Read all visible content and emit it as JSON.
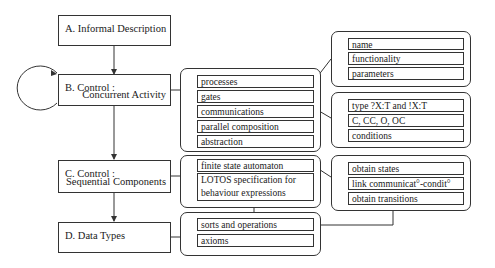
{
  "stages": {
    "a": {
      "line1": "A. Informal Description",
      "line2": ""
    },
    "b": {
      "line1": "B. Control :",
      "line2": "Concurrent Activity"
    },
    "c": {
      "line1": "C. Control :",
      "line2": "Sequential Components"
    },
    "d": {
      "line1": "D. Data Types",
      "line2": ""
    }
  },
  "groups": {
    "concurrent": {
      "items": [
        "processes",
        "gates",
        "communications",
        "parallel composition",
        "abstraction"
      ]
    },
    "sequential": {
      "items": [
        "finite state automaton",
        "LOTOS specification for behaviour expressions"
      ]
    },
    "datatypes": {
      "items": [
        "sorts and operations",
        "axioms"
      ]
    },
    "process_details": {
      "items": [
        "name",
        "functionality",
        "parameters"
      ]
    },
    "communication_details": {
      "items": [
        "type ?X:T and !X:T",
        "C, CC, O, OC",
        "conditions"
      ]
    },
    "automaton_details": {
      "items": [
        "obtain states",
        "link communicat°-condit°",
        "obtain transitions"
      ]
    }
  }
}
